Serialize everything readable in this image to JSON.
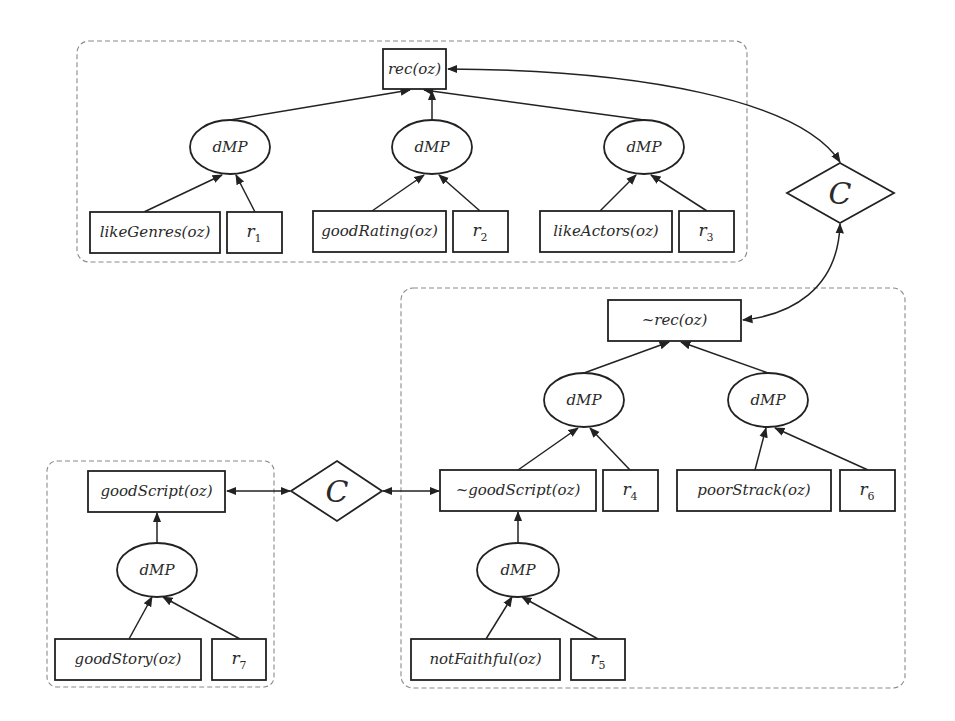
{
  "colors": {
    "stroke": "#222222",
    "frame": "#8a8a8a",
    "background": "#ffffff"
  },
  "groups": {
    "recommend": {
      "root": "rec(oz)",
      "dmp": [
        "dMP",
        "dMP",
        "dMP"
      ],
      "leaves": [
        {
          "premise": "likeGenres(oz)",
          "weight_base": "r",
          "weight_sub": "1"
        },
        {
          "premise": "goodRating(oz)",
          "weight_base": "r",
          "weight_sub": "2"
        },
        {
          "premise": "likeActors(oz)",
          "weight_base": "r",
          "weight_sub": "3"
        }
      ]
    },
    "not_recommend": {
      "root": "~rec(oz)",
      "dmp": [
        "dMP",
        "dMP",
        "dMP"
      ],
      "leaves": [
        {
          "premise": "~goodScript(oz)",
          "weight_base": "r",
          "weight_sub": "4"
        },
        {
          "premise": "poorStrack(oz)",
          "weight_base": "r",
          "weight_sub": "6"
        },
        {
          "premise": "notFaithful(oz)",
          "weight_base": "r",
          "weight_sub": "5"
        }
      ]
    },
    "good_script": {
      "root": "goodScript(oz)",
      "dmp": [
        "dMP"
      ],
      "leaves": [
        {
          "premise": "goodStory(oz)",
          "weight_base": "r",
          "weight_sub": "7"
        }
      ]
    }
  },
  "conflicts": [
    {
      "label": "C",
      "between": [
        "rec(oz)",
        "~rec(oz)"
      ]
    },
    {
      "label": "C",
      "between": [
        "goodScript(oz)",
        "~goodScript(oz)"
      ]
    }
  ]
}
